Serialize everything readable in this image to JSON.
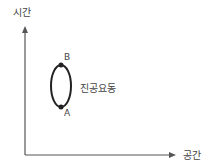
{
  "diagram": {
    "y_axis_label": "시간",
    "x_axis_label": "공간",
    "loop_label": "진공요동",
    "points": [
      {
        "name": "B",
        "position": "top"
      },
      {
        "name": "A",
        "position": "bottom"
      }
    ],
    "colors": {
      "axis": "#555555",
      "loop": "#222222",
      "text": "#444444"
    }
  }
}
